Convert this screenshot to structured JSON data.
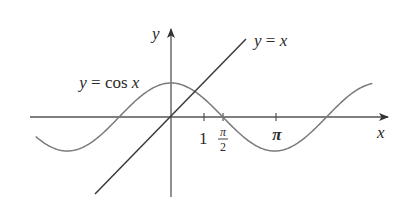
{
  "diagram": {
    "axes": {
      "x_label": "x",
      "y_label": "y",
      "x_ticks": [
        {
          "value": 1,
          "label": "1"
        },
        {
          "value": 1.5708,
          "label_num": "π",
          "label_den": "2"
        },
        {
          "value": 3.1416,
          "label": "π"
        }
      ]
    },
    "curves": [
      {
        "name": "cosine",
        "label": "y = cos x",
        "label_parts": {
          "lhs": "y",
          "eq": " = cos ",
          "var": "x"
        },
        "color": "#7a7a7a"
      },
      {
        "name": "identity",
        "label": "y = x",
        "label_parts": {
          "lhs": "y",
          "eq": " = ",
          "var": "x"
        },
        "color": "#3a3a3a"
      }
    ],
    "colors": {
      "axis": "#555555",
      "text": "#2a2a2a",
      "background": "#ffffff"
    }
  },
  "chart_data": {
    "type": "line",
    "title": "",
    "xlabel": "x",
    "ylabel": "y",
    "xlim": [
      -4.2,
      6.5
    ],
    "ylim": [
      -2.4,
      2.7
    ],
    "grid": false,
    "legend": "inline labels",
    "x_ticks": [
      1,
      1.5708,
      3.1416
    ],
    "x_tick_labels": [
      "1",
      "π/2",
      "π"
    ],
    "series": [
      {
        "name": "y = cos x",
        "function": "cos(x)",
        "x_range": [
          -4.1,
          6.1
        ]
      },
      {
        "name": "y = x",
        "function": "x",
        "x_range": [
          -2.3,
          2.3
        ]
      }
    ],
    "annotations": [
      "y = cos x",
      "y = x"
    ]
  }
}
